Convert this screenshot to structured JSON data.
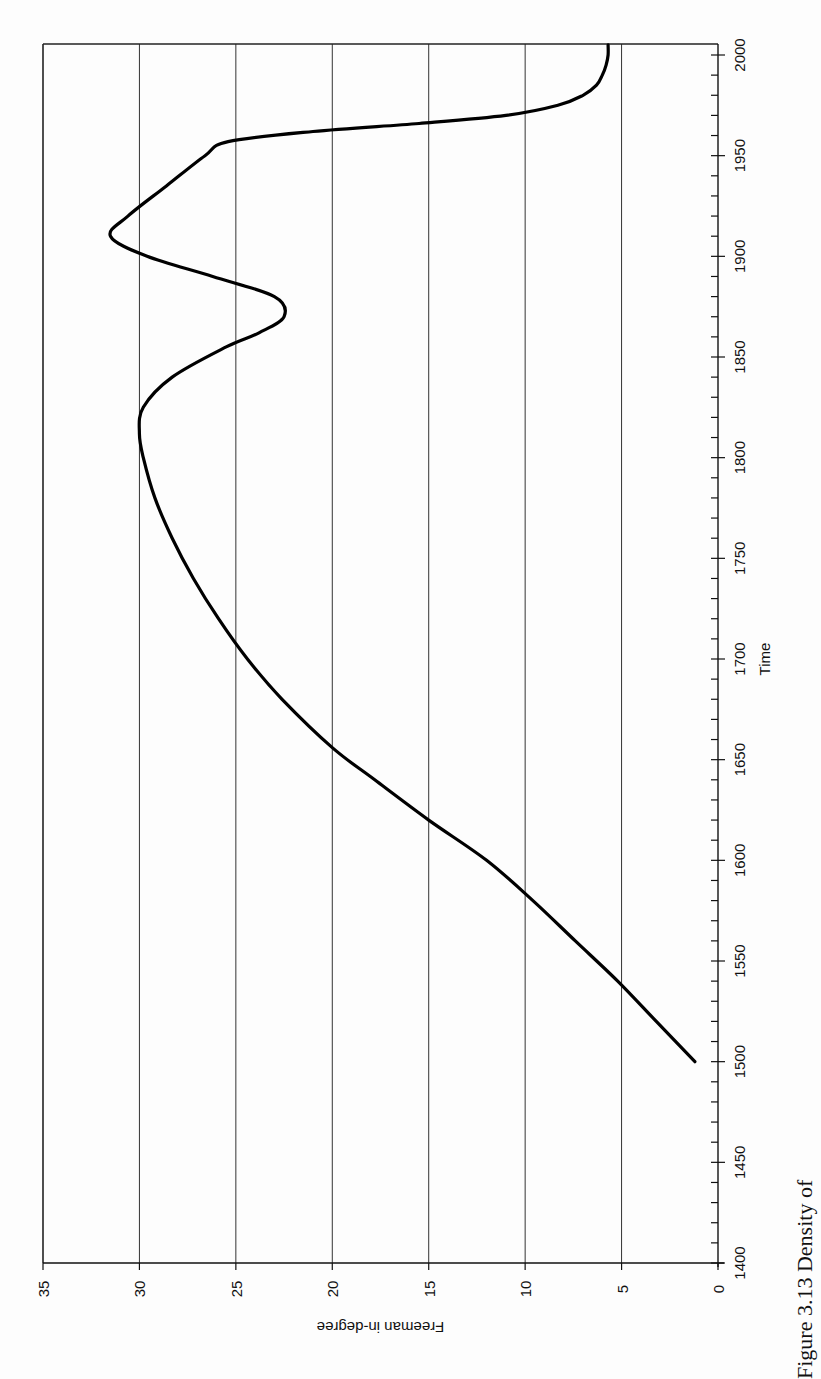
{
  "chart_data": {
    "type": "line",
    "title": "",
    "orientation": "rotated-90-clockwise-scan",
    "xlabel": "Time",
    "ylabel": "Freeman in-degree",
    "xlim": [
      1400,
      2000
    ],
    "ylim": [
      0,
      35
    ],
    "x_ticks": [
      1400,
      1450,
      1500,
      1550,
      1600,
      1650,
      1700,
      1750,
      1800,
      1850,
      1900,
      1950,
      2000
    ],
    "x_minor_tick_step": 10,
    "y_ticks": [
      0,
      5,
      10,
      15,
      20,
      25,
      30,
      35
    ],
    "grid": {
      "y_major": true,
      "x": false
    },
    "legend": null,
    "series": [
      {
        "name": "Freeman in-degree",
        "x": [
          1500,
          1520,
          1540,
          1560,
          1580,
          1600,
          1620,
          1640,
          1656,
          1680,
          1700,
          1720,
          1740,
          1760,
          1780,
          1800,
          1812,
          1825,
          1840,
          1855,
          1862,
          1870,
          1880,
          1890,
          1900,
          1910,
          1920,
          1935,
          1950,
          1957,
          1962,
          1966,
          1970,
          1975,
          1980,
          1985,
          1990,
          1995,
          2000,
          2005
        ],
        "values": [
          1.2,
          3.2,
          5.2,
          7.4,
          9.6,
          12.0,
          15.0,
          17.8,
          20.0,
          22.6,
          24.4,
          25.9,
          27.2,
          28.3,
          29.2,
          29.8,
          30.0,
          29.8,
          28.3,
          25.5,
          23.8,
          22.5,
          23.0,
          26.2,
          29.6,
          31.5,
          30.6,
          28.6,
          26.6,
          25.4,
          21.0,
          15.5,
          11.0,
          8.3,
          7.0,
          6.3,
          6.0,
          5.8,
          5.7,
          5.7
        ]
      }
    ],
    "caption_partial": "Figure 3.13 Density of ..."
  },
  "labels": {
    "xlabel": "Time",
    "ylabel": "Freeman in-degree",
    "caption": "Figure 3.13 Density of"
  }
}
